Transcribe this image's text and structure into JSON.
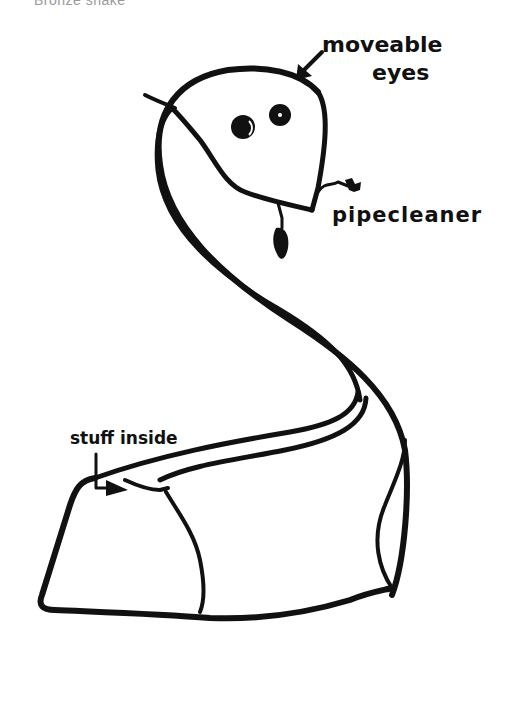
{
  "title": "Bronze snake",
  "labels": {
    "eyes_line1": "moveable",
    "eyes_line2": "eyes",
    "tongue": "pipecleaner",
    "body": "stuff inside"
  },
  "colors": {
    "background": "#ffffff",
    "ink": "#111111",
    "title": "#9a9a9a"
  }
}
